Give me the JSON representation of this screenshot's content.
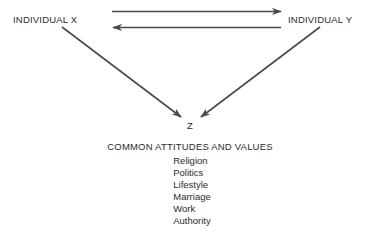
{
  "diagram": {
    "type": "relationship-diagram",
    "nodes": {
      "individual_x": "INDIVIDUAL X",
      "individual_y": "INDIVIDUAL Y",
      "z": "Z"
    },
    "values_heading": "COMMON ATTITUDES AND VALUES",
    "values": [
      "Religion",
      "Politics",
      "Lifestyle",
      "Marriage",
      "Work",
      "Authority"
    ],
    "arrows": [
      {
        "name": "x-to-y",
        "direction": "right"
      },
      {
        "name": "y-to-x",
        "direction": "left"
      },
      {
        "name": "x-to-z",
        "direction": "down-right"
      },
      {
        "name": "y-to-z",
        "direction": "down-left"
      }
    ],
    "colors": {
      "ink": "#2b2b2b",
      "arrow": "#4a4a4a",
      "background": "#ffffff"
    }
  }
}
